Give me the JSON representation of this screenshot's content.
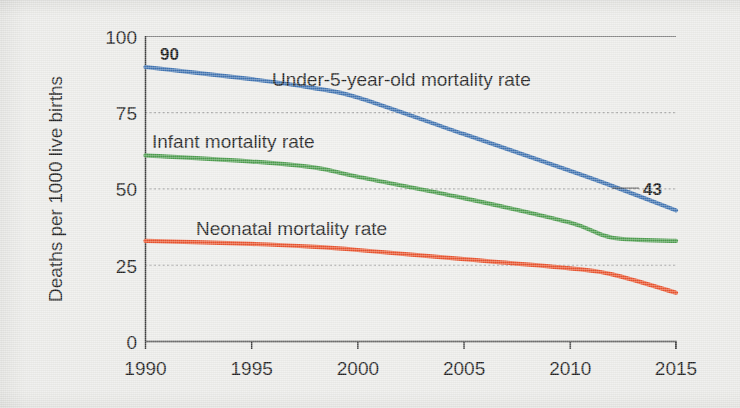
{
  "chart_data": {
    "type": "line",
    "title": "",
    "xlabel": "",
    "ylabel": "Deaths per 1000 live births",
    "xlim": [
      1990,
      2015
    ],
    "ylim": [
      0,
      100
    ],
    "grid": true,
    "legend_position": "inline-labels",
    "x_ticks": [
      "1990",
      "1995",
      "2000",
      "2005",
      "2010",
      "2015"
    ],
    "x_tick_values": [
      1990,
      1995,
      2000,
      2005,
      2010,
      2015
    ],
    "y_ticks": [
      "0",
      "25",
      "50",
      "75",
      "100"
    ],
    "y_tick_values": [
      0,
      25,
      50,
      75,
      100
    ],
    "x": [
      1990,
      1995,
      1998,
      2000,
      2005,
      2010,
      2012,
      2015
    ],
    "series": [
      {
        "name": "Under-5-year-old mortality rate",
        "color": "#3e72b0",
        "values": [
          90,
          86,
          83,
          80,
          68,
          56,
          51,
          43
        ],
        "label_x": 2001,
        "label_y": 86,
        "annotations": [
          {
            "text": "90",
            "x": 1990,
            "y": 90
          },
          {
            "text": "43",
            "x": 2015,
            "y": 43
          }
        ]
      },
      {
        "name": "Infant mortality rate",
        "color": "#4b9b4c",
        "values": [
          61,
          59,
          57,
          54,
          47,
          39,
          34,
          33
        ],
        "label_x": 1991,
        "label_y": 68,
        "annotations": []
      },
      {
        "name": "Neonatal mortality rate",
        "color": "#e8512b",
        "values": [
          33,
          32,
          31,
          30,
          27,
          24,
          22,
          16
        ],
        "label_x": 1993,
        "label_y": 39,
        "annotations": []
      }
    ]
  }
}
